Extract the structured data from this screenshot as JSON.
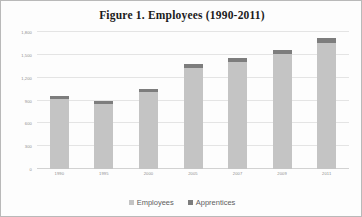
{
  "figure": {
    "title": "Figure 1.  Employees (1990-2011)"
  },
  "legend": {
    "position": "bottom-center",
    "entries": [
      {
        "label": "Employees",
        "color": "#c4c4c4",
        "swatch_name": "employees-swatch"
      },
      {
        "label": "Apprentices",
        "color": "#7d7d7d",
        "swatch_name": "apprentices-swatch"
      }
    ]
  },
  "chart_data": {
    "type": "bar",
    "subtype": "stacked-column",
    "title": "Figure 1.  Employees (1990-2011)",
    "xlabel": "",
    "ylabel": "",
    "categories": [
      "1990",
      "1995",
      "2000",
      "2005",
      "2007",
      "2009",
      "2011"
    ],
    "series": [
      {
        "name": "Employees",
        "color": "#c4c4c4",
        "values": [
          920,
          860,
          1010,
          1330,
          1410,
          1510,
          1660
        ]
      },
      {
        "name": "Apprentices",
        "color": "#7d7d7d",
        "values": [
          45,
          40,
          45,
          55,
          50,
          55,
          60
        ]
      }
    ],
    "totals": [
      965,
      900,
      1055,
      1385,
      1460,
      1565,
      1720
    ],
    "ylim": [
      0,
      1800
    ],
    "ytick_values": [
      0,
      300,
      600,
      900,
      1200,
      1500,
      1800
    ],
    "ytick_labels": [
      "0",
      "300",
      "600",
      "900",
      "1,200",
      "1,500",
      "1,800"
    ],
    "grid": true,
    "grid_axis": "y",
    "legend_position": "bottom"
  },
  "colors": {
    "employees": "#c4c4c4",
    "apprentices": "#7d7d7d",
    "gridline": "#e4e4e4",
    "axis_text": "#8d8d8d",
    "title_text": "#1b1b1b",
    "legend_text": "#5d5d5d",
    "background": "#fdfdfd",
    "border": "#b9b9b9"
  }
}
